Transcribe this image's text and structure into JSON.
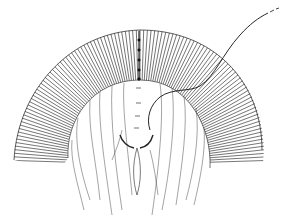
{
  "figure": {
    "kind": "anatomical line illustration",
    "background_color": "#ffffff",
    "ink_color": "#1a1a1a",
    "elements": [
      {
        "name": "arched-radial-band",
        "description": "semicircular band of radial hatch lines"
      },
      {
        "name": "central-suture-line",
        "description": "vertical seam with stitch marks at top center"
      },
      {
        "name": "suture-thread",
        "description": "curved thread passing through band, exiting top right with dashed end"
      },
      {
        "name": "inner-fibers",
        "description": "branching vertical fiber lines inside the arch"
      },
      {
        "name": "central-spindle",
        "description": "elongated lens-shaped structure at center bottom"
      }
    ]
  }
}
